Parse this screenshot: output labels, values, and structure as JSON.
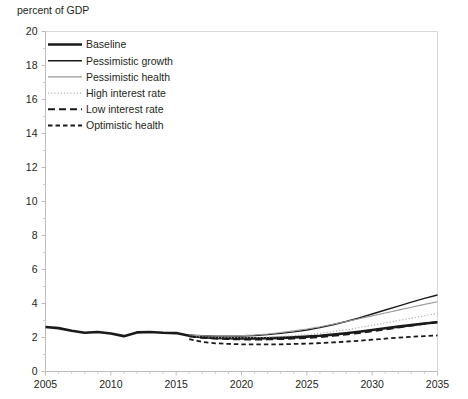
{
  "chart_data": {
    "type": "line",
    "title": "percent of GDP",
    "xlabel": "",
    "ylabel": "percent of GDP",
    "xlim": [
      2005,
      2035
    ],
    "ylim": [
      0,
      20
    ],
    "ytick_step": 2,
    "xtick_step": 5,
    "minor_xtick_step": 1,
    "grid": false,
    "legend_position": "upper-left-inside",
    "ytick_labels": [
      "0",
      "2",
      "4",
      "6",
      "8",
      "10",
      "12",
      "14",
      "16",
      "18",
      "20"
    ],
    "xtick_labels": [
      "2005",
      "2010",
      "2015",
      "2020",
      "2025",
      "2030",
      "2035"
    ],
    "x": [
      2005,
      2006,
      2007,
      2008,
      2009,
      2010,
      2011,
      2012,
      2013,
      2014,
      2015,
      2016,
      2017,
      2018,
      2019,
      2020,
      2021,
      2022,
      2023,
      2024,
      2025,
      2026,
      2027,
      2028,
      2029,
      2030,
      2031,
      2032,
      2033,
      2034,
      2035
    ],
    "series": [
      {
        "name": "Baseline",
        "style": "solid-thick",
        "color": "#1a1a1a",
        "width": 2.6,
        "values": [
          2.62,
          2.55,
          2.4,
          2.28,
          2.32,
          2.24,
          2.08,
          2.3,
          2.32,
          2.28,
          2.26,
          2.1,
          2.02,
          1.98,
          1.96,
          1.95,
          1.95,
          1.96,
          1.98,
          2.01,
          2.05,
          2.1,
          2.17,
          2.25,
          2.34,
          2.44,
          2.54,
          2.64,
          2.73,
          2.82,
          2.9
        ]
      },
      {
        "name": "Pessimistic growth",
        "style": "solid-medium",
        "color": "#1a1a1a",
        "width": 1.4,
        "values": [
          2.62,
          2.55,
          2.4,
          2.28,
          2.32,
          2.24,
          2.08,
          2.3,
          2.32,
          2.28,
          2.26,
          2.14,
          2.1,
          2.08,
          2.08,
          2.09,
          2.12,
          2.17,
          2.24,
          2.33,
          2.44,
          2.58,
          2.75,
          2.94,
          3.15,
          3.38,
          3.62,
          3.85,
          4.08,
          4.3,
          4.5
        ]
      },
      {
        "name": "Pessimistic health",
        "style": "solid-thin",
        "color": "#9a9a9a",
        "width": 1.1,
        "values": [
          2.62,
          2.55,
          2.4,
          2.28,
          2.32,
          2.24,
          2.08,
          2.3,
          2.32,
          2.28,
          2.26,
          2.14,
          2.1,
          2.09,
          2.09,
          2.11,
          2.15,
          2.21,
          2.29,
          2.39,
          2.5,
          2.63,
          2.78,
          2.94,
          3.1,
          3.27,
          3.44,
          3.61,
          3.78,
          3.95,
          4.1
        ]
      },
      {
        "name": "High interest rate",
        "style": "dotted",
        "color": "#a8a8a8",
        "width": 1.2,
        "values": [
          2.62,
          2.55,
          2.4,
          2.28,
          2.32,
          2.24,
          2.08,
          2.3,
          2.32,
          2.28,
          2.26,
          2.1,
          2.03,
          2.0,
          1.99,
          1.99,
          2.0,
          2.02,
          2.06,
          2.11,
          2.17,
          2.25,
          2.35,
          2.46,
          2.58,
          2.72,
          2.86,
          3.0,
          3.14,
          3.28,
          3.42
        ]
      },
      {
        "name": "Low interest rate",
        "style": "dash-long",
        "color": "#1a1a1a",
        "width": 2.0,
        "values": [
          2.62,
          2.55,
          2.4,
          2.28,
          2.32,
          2.24,
          2.08,
          2.3,
          2.32,
          2.28,
          2.26,
          2.08,
          1.99,
          1.94,
          1.91,
          1.89,
          1.88,
          1.89,
          1.91,
          1.94,
          1.98,
          2.03,
          2.1,
          2.18,
          2.27,
          2.37,
          2.48,
          2.59,
          2.7,
          2.81,
          2.92
        ]
      },
      {
        "name": "Optimistic health",
        "style": "dash-short",
        "color": "#1a1a1a",
        "width": 1.8,
        "values": [
          2.62,
          2.55,
          2.4,
          2.28,
          2.32,
          2.24,
          2.08,
          2.3,
          2.32,
          2.28,
          2.26,
          1.9,
          1.74,
          1.66,
          1.62,
          1.6,
          1.59,
          1.59,
          1.6,
          1.62,
          1.64,
          1.67,
          1.71,
          1.76,
          1.81,
          1.87,
          1.93,
          1.99,
          2.04,
          2.08,
          2.12
        ]
      }
    ],
    "historical_end_year": 2016,
    "legend_entries": [
      {
        "label": "Baseline",
        "style": "solid-thick",
        "color": "#1a1a1a"
      },
      {
        "label": "Pessimistic growth",
        "style": "solid-medium",
        "color": "#1a1a1a"
      },
      {
        "label": "Pessimistic health",
        "style": "solid-thin",
        "color": "#9a9a9a"
      },
      {
        "label": "High interest rate",
        "style": "dotted",
        "color": "#a8a8a8"
      },
      {
        "label": "Low interest rate",
        "style": "dash-long",
        "color": "#1a1a1a"
      },
      {
        "label": "Optimistic health",
        "style": "dash-short",
        "color": "#1a1a1a"
      }
    ]
  }
}
